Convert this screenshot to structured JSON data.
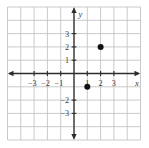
{
  "figure": {
    "background": "#ffffff"
  },
  "chart_data": {
    "type": "scatter",
    "title": "",
    "xlabel": "x",
    "ylabel": "y",
    "points": [
      {
        "x": 2,
        "y": 2
      },
      {
        "x": 1,
        "y": -1
      }
    ],
    "grid_on": true,
    "grid_range": [
      -5,
      5
    ],
    "xlim": [
      -5,
      5
    ],
    "ylim": [
      -5,
      5
    ],
    "x_ticks": [
      {
        "v": -3,
        "label": "−3"
      },
      {
        "v": -2,
        "label": "−2"
      },
      {
        "v": -1,
        "label": "−1"
      },
      {
        "v": 1,
        "label": "1"
      },
      {
        "v": 2,
        "label": "2"
      },
      {
        "v": 3,
        "label": "3"
      }
    ],
    "y_ticks": [
      {
        "v": 3,
        "label": "3"
      },
      {
        "v": 2,
        "label": "2"
      },
      {
        "v": 1,
        "label": "1"
      },
      {
        "v": -2,
        "label": "−2"
      },
      {
        "v": -3,
        "label": "−3"
      }
    ],
    "colors": {
      "grid": "#c4c4c4",
      "axis": "#2c2c2c",
      "tick_text": "#3a3a3a",
      "point": "#111111",
      "background": "#ffffff"
    }
  }
}
